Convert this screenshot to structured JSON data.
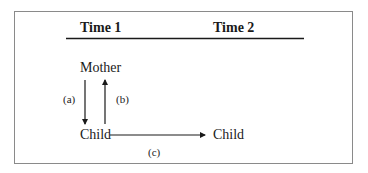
{
  "diagram": {
    "headers": {
      "time1": "Time 1",
      "time2": "Time 2"
    },
    "nodes": {
      "mother": "Mother",
      "child_t1": "Child",
      "child_t2": "Child"
    },
    "edges": [
      {
        "id": "a",
        "label": "(a)",
        "from": "Mother",
        "to": "Child (Time 1)"
      },
      {
        "id": "b",
        "label": "(b)",
        "from": "Child (Time 1)",
        "to": "Mother"
      },
      {
        "id": "c",
        "label": "(c)",
        "from": "Child (Time 1)",
        "to": "Child (Time 2)"
      }
    ]
  }
}
